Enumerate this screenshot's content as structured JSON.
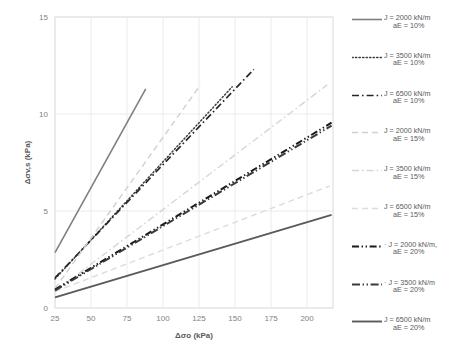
{
  "chart_data": {
    "type": "line",
    "title": "",
    "xlabel": "Δσo (kPa)",
    "ylabel": "Δσv,s (kPa)",
    "xlim": [
      25,
      218
    ],
    "ylim": [
      0,
      15
    ],
    "xticks": [
      25,
      50,
      75,
      100,
      125,
      150,
      175,
      200
    ],
    "yticks": [
      0,
      5,
      10,
      15
    ],
    "grid": true,
    "legend_position": "right",
    "series": [
      {
        "name": "J = 2000 kN/m aE = 10%",
        "label_line1": "J = 2000 kN/m",
        "label_line2": "aE = 10%",
        "style": "solid",
        "color": "#808080",
        "width": 1.6,
        "x": [
          25,
          88
        ],
        "y": [
          2.85,
          11.3
        ]
      },
      {
        "name": "J = 3500 kN/m aE = 10%",
        "label_line1": "J = 3500 kN/m",
        "label_line2": "aE = 10%",
        "style": "dotted",
        "color": "#3f3f3f",
        "width": 1.5,
        "x": [
          25,
          148
        ],
        "y": [
          1.5,
          11.4
        ]
      },
      {
        "name": "J = 6500 kN/m aE = 10%",
        "label_line1": "J = 6500 kN/m",
        "label_line2": "aE = 10%",
        "style": "dashdot",
        "color": "#262626",
        "width": 1.7,
        "x": [
          25,
          163
        ],
        "y": [
          1.55,
          12.3
        ]
      },
      {
        "name": "J = 2000 kN/m aE = 15%",
        "label_line1": "J = 2000 kN/m",
        "label_line2": "aE = 15%",
        "style": "dashed",
        "color": "#d0d0d0",
        "width": 1.4,
        "x": [
          25,
          126
        ],
        "y": [
          1.0,
          11.5
        ]
      },
      {
        "name": "J = 3500 kN/m aE = 15%",
        "label_line1": "J = 3500 kN/m",
        "label_line2": "aE = 15%",
        "style": "dashdot",
        "color": "#d6d6d6",
        "width": 1.4,
        "x": [
          25,
          214
        ],
        "y": [
          0.85,
          11.5
        ]
      },
      {
        "name": "J = 6500 kN/m aE = 15%",
        "label_line1": "J = 6500 kN/m",
        "label_line2": "aE = 15%",
        "style": "dashed",
        "color": "#dcdcdc",
        "width": 1.4,
        "x": [
          25,
          216
        ],
        "y": [
          0.85,
          6.3
        ]
      },
      {
        "name": "J = 2000 kN/m, aE = 20%",
        "label_line1": "· J = 2000 kN/m,",
        "label_line2": "aE = 20%",
        "style": "dashdotdot",
        "color": "#1a1a1a",
        "width": 2.0,
        "x": [
          25,
          217
        ],
        "y": [
          0.95,
          9.55
        ]
      },
      {
        "name": "J = 3500 kN/m aE = 20%",
        "label_line1": "· J = 3500 kN/m",
        "label_line2": "aE = 20%",
        "style": "dashdotdot2",
        "color": "#3a3a3a",
        "width": 2.0,
        "x": [
          25,
          217
        ],
        "y": [
          0.9,
          9.4
        ]
      },
      {
        "name": "J = 6500 kN/m aE = 20%",
        "label_line1": "J = 6500 kN/m",
        "label_line2": "aE = 20%",
        "style": "solid",
        "color": "#5a5a5a",
        "width": 1.9,
        "x": [
          25,
          217
        ],
        "y": [
          0.55,
          4.8
        ]
      }
    ]
  }
}
